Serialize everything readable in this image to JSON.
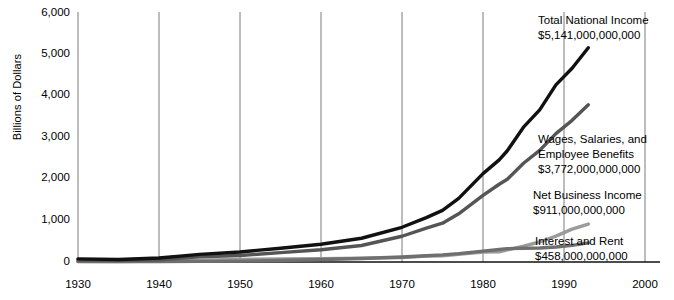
{
  "chart_data": {
    "type": "line",
    "title": "",
    "xlabel": "",
    "ylabel": "Billions of Dollars",
    "xlim": [
      1930,
      2000
    ],
    "ylim": [
      0,
      6000
    ],
    "grid": "vertical gridlines at each decade",
    "legend_position": "inline annotations at right end of each series",
    "units": "Billions of Dollars",
    "x_ticks": [
      "1930",
      "1940",
      "1950",
      "1960",
      "1970",
      "1980",
      "1990",
      "2000"
    ],
    "y_ticks": [
      "0",
      "1,000",
      "2,000",
      "3,000",
      "4,000",
      "5,000",
      "6,000"
    ],
    "x": [
      1930,
      1935,
      1940,
      1945,
      1950,
      1955,
      1960,
      1965,
      1970,
      1973,
      1975,
      1977,
      1980,
      1982,
      1983,
      1985,
      1987,
      1989,
      1991,
      1993
    ],
    "series": [
      {
        "name": "Total National Income",
        "color": "#111111",
        "end_label": "Total National Income",
        "end_value_label": "$5,141,000,000,000",
        "values": [
          76,
          60,
          95,
          182,
          241,
          331,
          427,
          570,
          833,
          1065,
          1239,
          1527,
          2121,
          2450,
          2670,
          3235,
          3650,
          4250,
          4650,
          5141
        ]
      },
      {
        "name": "Wages, Salaries, and Employee Benefits",
        "color": "#555555",
        "end_label_line1": "Wages, Salaries, and",
        "end_label_line2": "Employee Benefits",
        "end_value_label": "$3,772,000,000,000",
        "values": [
          51,
          38,
          53,
          123,
          155,
          224,
          295,
          396,
          618,
          814,
          931,
          1157,
          1600,
          1866,
          1985,
          2370,
          2680,
          3080,
          3400,
          3772
        ]
      },
      {
        "name": "Net Business Income",
        "color": "#9b9b9b",
        "end_label": "Net Business Income",
        "end_value_label": "$911,000,000,000",
        "values": [
          15,
          12,
          25,
          45,
          63,
          73,
          78,
          92,
          105,
          140,
          150,
          185,
          240,
          245,
          290,
          380,
          480,
          620,
          790,
          911
        ]
      },
      {
        "name": "Interest and Rent",
        "color": "#6f6f6f",
        "end_label": "Interest and Rent",
        "end_value_label": "$458,000,000,000",
        "values": [
          10,
          8,
          11,
          14,
          22,
          36,
          60,
          85,
          120,
          150,
          170,
          200,
          260,
          300,
          320,
          330,
          335,
          360,
          400,
          458
        ]
      }
    ]
  },
  "axis": {
    "y_title": "Billions of Dollars"
  },
  "annotations": {
    "total": {
      "label": "Total National Income",
      "value": "$5,141,000,000,000"
    },
    "wages": {
      "label_line1": "Wages, Salaries, and",
      "label_line2": "Employee Benefits",
      "value": "$3,772,000,000,000"
    },
    "net_business": {
      "label": "Net Business Income",
      "value": "$911,000,000,000"
    },
    "interest_rent": {
      "label": "Interest and Rent",
      "value": "$458,000,000,000"
    }
  },
  "y_ticks": [
    {
      "label": "6,000"
    },
    {
      "label": "5,000"
    },
    {
      "label": "4,000"
    },
    {
      "label": "3,000"
    },
    {
      "label": "2,000"
    },
    {
      "label": "1,000"
    },
    {
      "label": "0"
    }
  ],
  "x_ticks": [
    {
      "label": "1930"
    },
    {
      "label": "1940"
    },
    {
      "label": "1950"
    },
    {
      "label": "1960"
    },
    {
      "label": "1970"
    },
    {
      "label": "1980"
    },
    {
      "label": "1990"
    },
    {
      "label": "2000"
    }
  ]
}
